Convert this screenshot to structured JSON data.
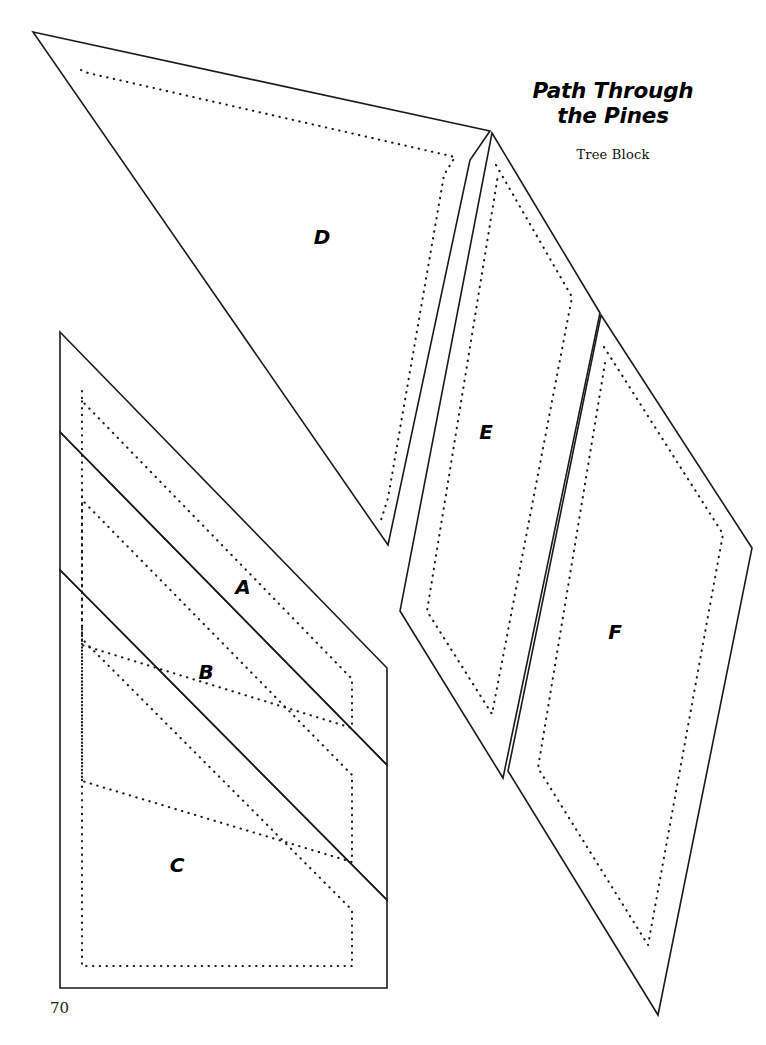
{
  "document": {
    "title_line1": "Path Through",
    "title_line2": "the Pines",
    "subtitle": "Tree Block",
    "page_number": "70",
    "background_color": "#ffffff",
    "line_color": "#1a1a1a"
  },
  "legend": {
    "cut_line_style": "solid",
    "seam_line_style": "dotted"
  },
  "pieces": [
    {
      "id": "A",
      "label": "A",
      "label_x": 243,
      "label_y": 588,
      "cut_path": "M 60 332 L 387 668 L 387 765 L 60 432 Z",
      "seam_path": "M 82 391 L 82 401 L 352 679 L 352 728 L 82 645 L 82 401"
    },
    {
      "id": "B",
      "label": "B",
      "label_x": 206,
      "label_y": 673,
      "cut_path": "M 60 432 L 387 765 L 387 900 L 60 570 Z",
      "seam_path": "M 82 490 L 82 500 L 352 775 L 352 862 L 82 781 L 82 500"
    },
    {
      "id": "C",
      "label": "C",
      "label_x": 177,
      "label_y": 866,
      "cut_path": "M 60 570 L 387 900 L 387 988 L 60 988 Z",
      "seam_path": "M 82 629 L 82 639 L 352 910 L 352 966 L 82 966 L 82 639"
    },
    {
      "id": "D",
      "label": "D",
      "label_x": 322,
      "label_y": 238,
      "cut_path": "M 33 32 L 490 131 L 470 160 L 388 545 Z",
      "seam_path": "M 81 70 L 88 73 L 455 157 L 444 175 L 388 498 L 381 520"
    },
    {
      "id": "E",
      "label": "E",
      "label_x": 486,
      "label_y": 433,
      "cut_path": "M 492 133 L 600 313 L 503 778 L 400 611 Z",
      "seam_path": "M 496 165 L 572 297 L 492 714 L 427 611 L 498 175"
    },
    {
      "id": "F",
      "label": "F",
      "label_x": 615,
      "label_y": 633,
      "cut_path": "M 601 315 L 752 548 L 658 1015 L 508 771 Z",
      "seam_path": "M 604 347 L 723 534 L 648 945 L 538 768 L 606 357"
    }
  ]
}
